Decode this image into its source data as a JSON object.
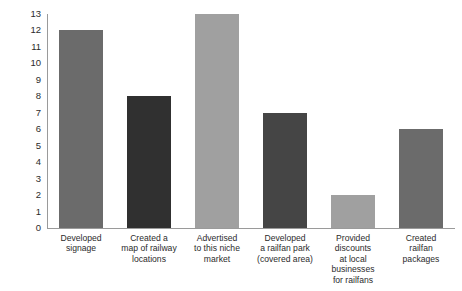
{
  "chart_data": {
    "type": "bar",
    "title": "",
    "subtitle": "",
    "xlabel": "",
    "ylabel": "",
    "categories": [
      "Developed\nsignage",
      "Created a\nmap of railway\nlocations",
      "Advertised\nto this niche\nmarket",
      "Developed\na railfan park\n(covered area)",
      "Provided\ndiscounts\nat local\nbusinesses\nfor railfans",
      "Created\nrailfan\npackages"
    ],
    "values": [
      12,
      8,
      13,
      7,
      2,
      6
    ],
    "bar_colors": [
      "#6b6b6b",
      "#303030",
      "#a0a0a0",
      "#454545",
      "#a0a0a0",
      "#6b6b6b"
    ],
    "ylim": [
      0,
      13
    ],
    "y_ticks": [
      0,
      1,
      2,
      3,
      4,
      5,
      6,
      7,
      8,
      9,
      10,
      11,
      12,
      13
    ],
    "y_tick_labels": [
      "0",
      "1",
      "2",
      "3",
      "4",
      "5",
      "6",
      "7",
      "8",
      "9",
      "10",
      "11",
      "12",
      "13"
    ],
    "grid": false,
    "legend": "none",
    "axis_color": "#9a9a9a",
    "text_color": "#2b2b2b",
    "background": "#ffffff"
  }
}
